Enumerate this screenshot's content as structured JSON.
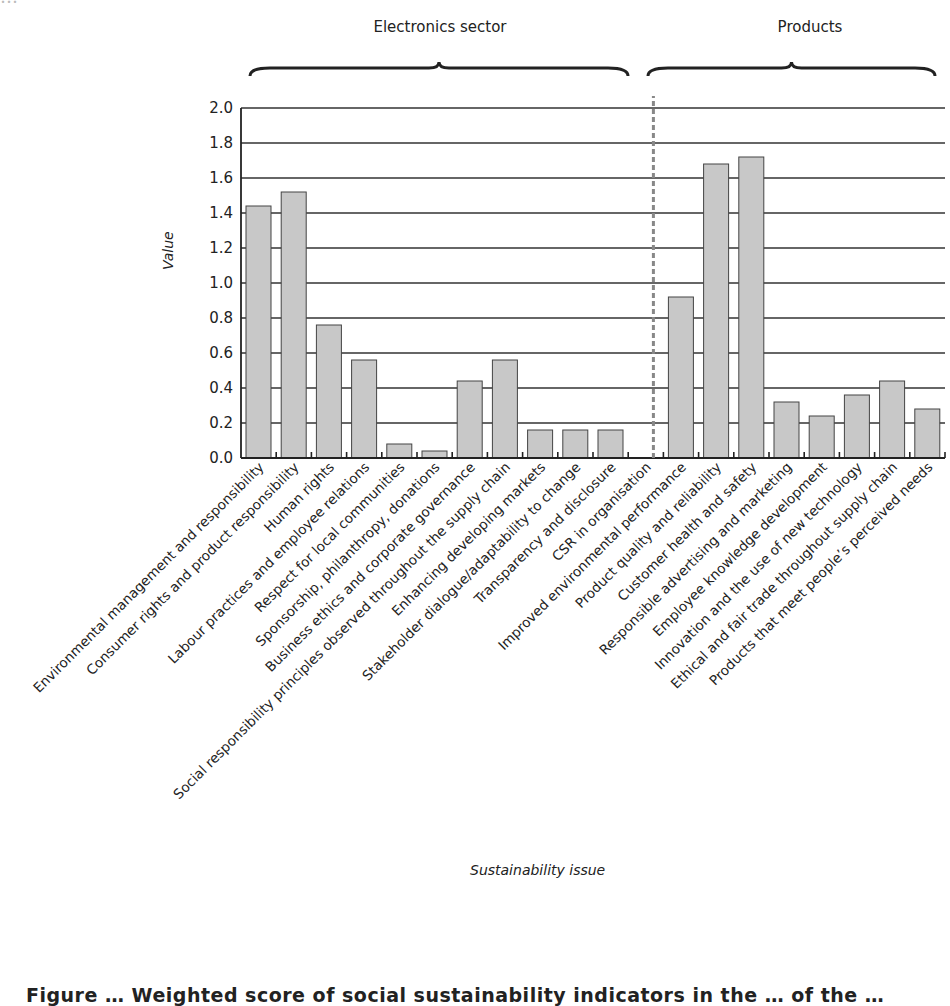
{
  "header": {
    "cut_text": "…"
  },
  "groups": [
    {
      "label": "Electronics sector"
    },
    {
      "label": "Products"
    }
  ],
  "axes": {
    "ylabel": "Value",
    "xlabel": "Sustainability issue",
    "yticks": [
      "0.0",
      "0.2",
      "0.4",
      "0.6",
      "0.8",
      "1.0",
      "1.2",
      "1.4",
      "1.6",
      "1.8",
      "2.0"
    ]
  },
  "caption": "Figure … Weighted score of social sustainability indicators in the … of the …",
  "chart_data": {
    "type": "bar",
    "title": "",
    "xlabel": "Sustainability issue",
    "ylabel": "Value",
    "ylim": [
      0,
      2.0
    ],
    "grid": true,
    "group_annotations": [
      {
        "label": "Electronics sector",
        "categories_from": 0,
        "categories_to": 11
      },
      {
        "label": "Products",
        "categories_from": 12,
        "categories_to": 19
      }
    ],
    "divider": "dashed vertical line between 'CSR in organisation' and 'Improved environmental performance'",
    "categories": [
      "Environmental management and responsibility",
      "Consumer rights and product responsibility",
      "Human rights",
      "Labour practices and employee relations",
      "Respect for local communities",
      "Sponsorship, philanthropy, donations",
      "Business ethics and corporate governance",
      "Social responsibility principles observed throughout the supply chain",
      "Enhancing developing markets",
      "Stakeholder dialogue/adaptability to change",
      "Transparency and disclosure",
      "CSR in organisation",
      "Improved environmental performance",
      "Product quality and reliability",
      "Customer health and safety",
      "Responsible advertising and marketing",
      "Employee knowledge development",
      "Innovation and the use of new technology",
      "Ethical and fair trade throughout supply chain",
      "Products that meet people’s perceived needs"
    ],
    "values": [
      1.44,
      1.52,
      0.76,
      0.56,
      0.08,
      0.04,
      0.44,
      0.56,
      0.16,
      0.16,
      0.16,
      0.0,
      0.92,
      1.68,
      1.72,
      0.32,
      0.24,
      0.36,
      0.44,
      0.28
    ],
    "colors": {
      "bar_fill": "#c8c8c8",
      "bar_stroke": "#444444",
      "grid": "#333333",
      "divider": "#888888"
    }
  }
}
